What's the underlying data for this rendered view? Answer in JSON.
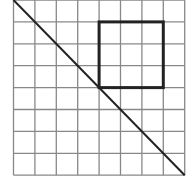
{
  "figure": {
    "label": ")",
    "grid": {
      "columns": 8,
      "rows": 8,
      "left": 13.5,
      "top": 0,
      "cell_w": 21.4,
      "cell_h": 21.9,
      "line_color": "#888888"
    },
    "square": {
      "col_start": 4,
      "row_start": 1,
      "size_cells": 3,
      "stroke": "#222222",
      "stroke_width": 3
    },
    "diagonal": {
      "from": "top-left",
      "to": "bottom-right",
      "stroke": "#222222",
      "stroke_width": 2
    }
  }
}
